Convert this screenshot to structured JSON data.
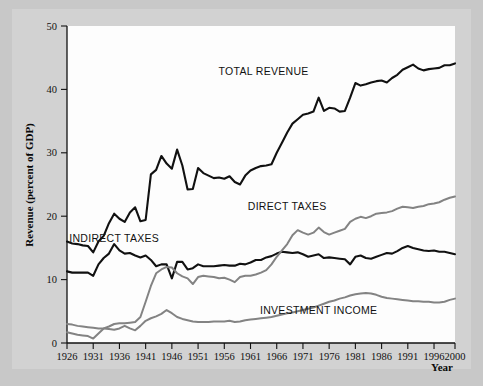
{
  "figure": {
    "background_color": "#c8c8c8",
    "plate_color": "#d2d2d2",
    "plot_background": "#fdfdfd"
  },
  "chart_data": {
    "type": "line",
    "title": "",
    "xlabel": "Year",
    "ylabel": "Revenue (percent of GDP)",
    "xlim": [
      1926,
      2000
    ],
    "ylim": [
      0,
      50
    ],
    "grid": false,
    "legend": "inline-annotations",
    "xticks": [
      1926,
      1931,
      1936,
      1941,
      1946,
      1951,
      1956,
      1961,
      1966,
      1971,
      1976,
      1981,
      1986,
      1991,
      1996,
      2000
    ],
    "xtick_labels": [
      "1926",
      "1931",
      "1936",
      "1941",
      "1946",
      "1951",
      "1956",
      "1961",
      "1966",
      "1971",
      "1976",
      "1981",
      "1986",
      "1991",
      "1996",
      "2000"
    ],
    "yticks": [
      0,
      10,
      20,
      30,
      40,
      50
    ],
    "ytick_labels": [
      "0",
      "10",
      "20",
      "30",
      "40",
      "50"
    ],
    "x": [
      1926,
      1927,
      1928,
      1929,
      1930,
      1931,
      1932,
      1933,
      1934,
      1935,
      1936,
      1937,
      1938,
      1939,
      1940,
      1941,
      1942,
      1943,
      1944,
      1945,
      1946,
      1947,
      1948,
      1949,
      1950,
      1951,
      1952,
      1953,
      1954,
      1955,
      1956,
      1957,
      1958,
      1959,
      1960,
      1961,
      1962,
      1963,
      1964,
      1965,
      1966,
      1967,
      1968,
      1969,
      1970,
      1971,
      1972,
      1973,
      1974,
      1975,
      1976,
      1977,
      1978,
      1979,
      1980,
      1981,
      1982,
      1983,
      1984,
      1985,
      1986,
      1987,
      1988,
      1989,
      1990,
      1991,
      1992,
      1993,
      1994,
      1995,
      1996,
      1997,
      1998,
      1999,
      2000
    ],
    "series": [
      {
        "name": "TOTAL REVENUE",
        "color": "#111111",
        "linewidth": 2.1,
        "label_x": 1963.5,
        "label_y": 42.3,
        "values": [
          16.0,
          15.7,
          15.6,
          15.4,
          15.3,
          14.3,
          16.0,
          16.9,
          18.9,
          20.4,
          19.6,
          19.1,
          20.6,
          21.4,
          19.2,
          19.4,
          26.6,
          27.3,
          29.5,
          28.3,
          27.5,
          30.5,
          28.0,
          24.2,
          24.3,
          27.6,
          26.8,
          26.4,
          26.0,
          26.1,
          25.9,
          26.3,
          25.4,
          25.0,
          26.4,
          27.2,
          27.6,
          27.9,
          28.0,
          28.2,
          30.0,
          31.6,
          33.2,
          34.6,
          35.3,
          36.0,
          36.2,
          36.5,
          38.7,
          36.6,
          37.1,
          37.0,
          36.5,
          36.6,
          38.7,
          41.0,
          40.6,
          40.8,
          41.1,
          41.3,
          41.4,
          41.1,
          41.8,
          42.3,
          43.1,
          43.5,
          43.9,
          43.3,
          43.0,
          43.2,
          43.3,
          43.4,
          43.8,
          43.8,
          44.1
        ]
      },
      {
        "name": "INDIRECT TAXES",
        "color": "#111111",
        "linewidth": 2.1,
        "label_x": 1935.0,
        "label_y": 16.0,
        "values": [
          11.3,
          11.1,
          11.1,
          11.1,
          11.1,
          10.6,
          12.4,
          13.4,
          14.1,
          15.6,
          14.6,
          14.1,
          14.2,
          13.8,
          13.5,
          13.8,
          13.1,
          12.1,
          12.4,
          12.4,
          10.2,
          12.8,
          12.8,
          11.6,
          11.8,
          12.4,
          12.1,
          12.1,
          12.1,
          12.2,
          12.3,
          12.2,
          12.2,
          12.5,
          12.4,
          12.7,
          13.1,
          13.1,
          13.5,
          13.7,
          14.1,
          14.4,
          14.3,
          14.2,
          14.3,
          14.0,
          13.6,
          13.8,
          14.0,
          13.4,
          13.5,
          13.4,
          13.3,
          13.2,
          12.4,
          13.6,
          13.8,
          13.4,
          13.3,
          13.6,
          13.9,
          14.2,
          14.1,
          14.5,
          15.0,
          15.3,
          15.0,
          14.8,
          14.6,
          14.5,
          14.6,
          14.4,
          14.4,
          14.2,
          14.0
        ]
      },
      {
        "name": "DIRECT TAXES",
        "color": "#838383",
        "linewidth": 2.0,
        "label_x": 1968.0,
        "label_y": 21.0,
        "values": [
          1.7,
          1.5,
          1.3,
          1.2,
          1.1,
          0.7,
          1.5,
          2.3,
          2.6,
          3.0,
          3.1,
          3.1,
          3.2,
          3.3,
          4.1,
          6.5,
          9.0,
          11.0,
          11.6,
          12.0,
          11.9,
          11.0,
          10.5,
          10.2,
          9.3,
          10.4,
          10.6,
          10.5,
          10.4,
          10.2,
          10.3,
          10.0,
          9.6,
          10.4,
          10.6,
          10.6,
          10.8,
          11.1,
          11.5,
          12.4,
          13.6,
          14.6,
          15.6,
          17.0,
          17.8,
          17.4,
          17.1,
          17.4,
          18.2,
          17.5,
          17.1,
          17.4,
          17.7,
          18.0,
          19.1,
          19.6,
          19.9,
          19.7,
          20.0,
          20.4,
          20.5,
          20.6,
          20.8,
          21.2,
          21.5,
          21.4,
          21.3,
          21.5,
          21.6,
          21.9,
          22.0,
          22.2,
          22.6,
          22.9,
          23.1
        ]
      },
      {
        "name": "INVESTMENT INCOME",
        "color": "#838383",
        "linewidth": 2.0,
        "label_x": 1974.0,
        "label_y": 4.5,
        "values": [
          3.0,
          2.9,
          2.7,
          2.6,
          2.5,
          2.4,
          2.3,
          2.3,
          2.2,
          2.1,
          2.3,
          2.7,
          2.3,
          2.0,
          2.7,
          3.5,
          3.9,
          4.2,
          4.6,
          5.2,
          4.7,
          4.1,
          3.8,
          3.6,
          3.4,
          3.3,
          3.3,
          3.3,
          3.4,
          3.4,
          3.4,
          3.5,
          3.3,
          3.4,
          3.6,
          3.7,
          3.8,
          3.9,
          4.0,
          4.1,
          4.3,
          4.5,
          4.7,
          4.8,
          5.0,
          5.2,
          5.4,
          5.6,
          5.9,
          6.2,
          6.5,
          6.7,
          7.0,
          7.2,
          7.5,
          7.7,
          7.8,
          7.9,
          7.8,
          7.6,
          7.3,
          7.1,
          7.0,
          6.9,
          6.8,
          6.7,
          6.6,
          6.6,
          6.5,
          6.5,
          6.4,
          6.4,
          6.5,
          6.8,
          7.0
        ]
      }
    ]
  }
}
